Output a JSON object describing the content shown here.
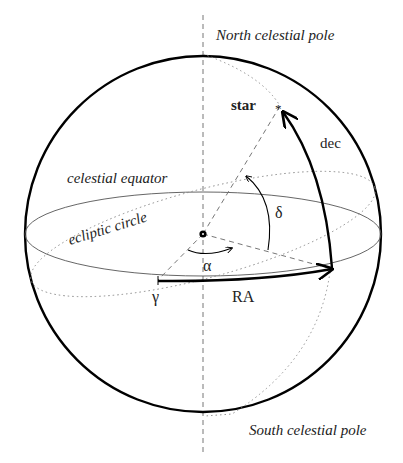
{
  "diagram": {
    "labels": {
      "north_pole": "North celestial pole",
      "south_pole": "South celestial pole",
      "star": "star",
      "dec": "dec",
      "celestial_equator": "celestial equator",
      "ecliptic_circle": "ecliptic circle",
      "delta": "δ",
      "alpha": "α",
      "gamma": "γ",
      "ra": "RA"
    },
    "colors": {
      "stroke": "#000000",
      "dashed": "#777777",
      "dotted": "#888888",
      "text": "#222222",
      "background": "#ffffff"
    }
  }
}
